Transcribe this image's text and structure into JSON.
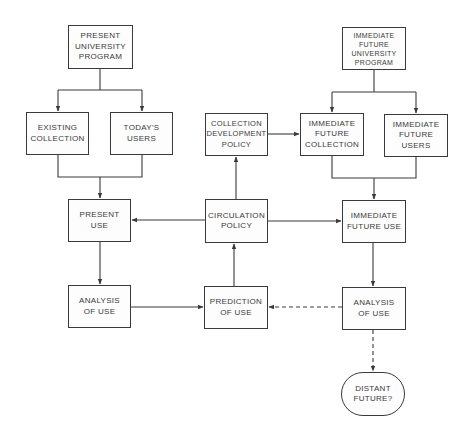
{
  "diagram": {
    "type": "flowchart",
    "nodes": {
      "present_program": {
        "label": "PRESENT\nUNIVERSITY\nPROGRAM"
      },
      "existing_collection": {
        "label": "EXISTING\nCOLLECTION"
      },
      "todays_users": {
        "label": "TODAY'S\nUSERS"
      },
      "collection_dev_policy": {
        "label": "COLLECTION\nDEVELOPMENT\nPOLICY"
      },
      "future_program": {
        "label": "IMMEDIATE\nFUTURE\nUNIVERSITY\nPROGRAM"
      },
      "future_collection": {
        "label": "IMMEDIATE\nFUTURE\nCOLLECTION"
      },
      "future_users": {
        "label": "IMMEDIATE\nFUTURE\nUSERS"
      },
      "present_use": {
        "label": "PRESENT\nUSE"
      },
      "circulation_policy": {
        "label": "CIRCULATION\nPOLICY"
      },
      "future_use": {
        "label": "IMMEDIATE\nFUTURE USE"
      },
      "analysis_left": {
        "label": "ANALYSIS\nOF USE"
      },
      "prediction": {
        "label": "PREDICTION\nOF    USE"
      },
      "analysis_right": {
        "label": "ANALYSIS\nOF USE"
      },
      "distant_future": {
        "label": "DISTANT\nFUTURE?"
      }
    },
    "edges": [
      {
        "from": "present_program",
        "to": "existing_collection",
        "style": "solid"
      },
      {
        "from": "present_program",
        "to": "todays_users",
        "style": "solid"
      },
      {
        "from": "existing_collection",
        "to": "present_use",
        "style": "solid"
      },
      {
        "from": "todays_users",
        "to": "present_use",
        "style": "solid"
      },
      {
        "from": "circulation_policy",
        "to": "present_use",
        "style": "solid"
      },
      {
        "from": "present_use",
        "to": "analysis_left",
        "style": "solid"
      },
      {
        "from": "analysis_left",
        "to": "prediction",
        "style": "solid"
      },
      {
        "from": "prediction",
        "to": "circulation_policy",
        "style": "solid"
      },
      {
        "from": "circulation_policy",
        "to": "collection_dev_policy",
        "style": "solid"
      },
      {
        "from": "collection_dev_policy",
        "to": "future_collection",
        "style": "solid"
      },
      {
        "from": "circulation_policy",
        "to": "future_use",
        "style": "solid"
      },
      {
        "from": "future_program",
        "to": "future_collection",
        "style": "solid"
      },
      {
        "from": "future_program",
        "to": "future_users",
        "style": "solid"
      },
      {
        "from": "future_collection",
        "to": "future_use",
        "style": "solid"
      },
      {
        "from": "future_users",
        "to": "future_use",
        "style": "solid"
      },
      {
        "from": "future_use",
        "to": "analysis_right",
        "style": "solid"
      },
      {
        "from": "analysis_right",
        "to": "prediction",
        "style": "dashed"
      },
      {
        "from": "analysis_right",
        "to": "distant_future",
        "style": "dashed"
      }
    ]
  },
  "colors": {
    "stroke": "#3a3a3a",
    "background": "#ffffff"
  }
}
